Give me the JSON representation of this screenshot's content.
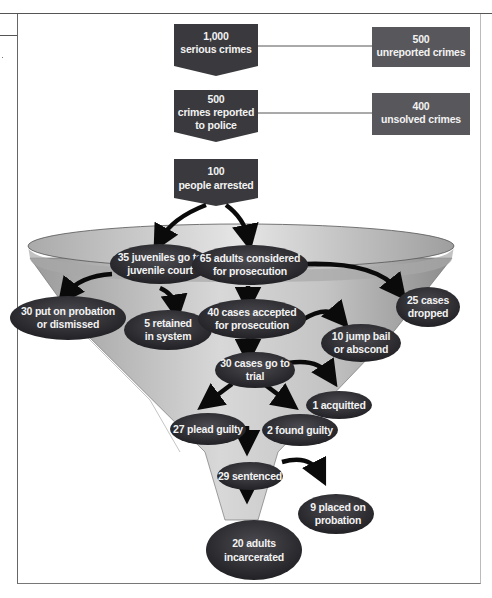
{
  "diagram": {
    "colors": {
      "box_fill": "#3a3a3e",
      "side_box_fill": "#58585c",
      "ellipse_fill": "#333338",
      "funnel_fill": "#bdbdbd",
      "arrow": "#0a0a0a",
      "text": "#f2f2f2"
    },
    "top_boxes": [
      {
        "id": "serious",
        "line1": "1,000",
        "line2": "serious crimes"
      },
      {
        "id": "reported",
        "line1": "500",
        "line2": "crimes reported",
        "line3": "to police"
      },
      {
        "id": "arrested",
        "line1": "100",
        "line2": "people arrested"
      }
    ],
    "side_boxes": [
      {
        "id": "unreported",
        "line1": "500",
        "line2": "unreported crimes"
      },
      {
        "id": "unsolved",
        "line1": "400",
        "line2": "unsolved crimes"
      }
    ],
    "nodes": [
      {
        "id": "juveniles",
        "line1": "35 juveniles go to",
        "line2": "juvenile court"
      },
      {
        "id": "adults",
        "line1": "65 adults considered",
        "line2": "for prosecution"
      },
      {
        "id": "probation_dismissed",
        "line1": "30 put on probation",
        "line2": "or dismissed"
      },
      {
        "id": "retained",
        "line1": "5 retained",
        "line2": "in system"
      },
      {
        "id": "accepted",
        "line1": "40 cases accepted",
        "line2": "for prosecution"
      },
      {
        "id": "dropped",
        "line1": "25 cases",
        "line2": "dropped"
      },
      {
        "id": "jump_bail",
        "line1": "10 jump bail",
        "line2": "or abscond"
      },
      {
        "id": "trial",
        "line1": "30 cases go to",
        "line2": "trial"
      },
      {
        "id": "acquitted",
        "line1": "1 acquitted"
      },
      {
        "id": "plead_guilty",
        "line1": "27 plead guilty"
      },
      {
        "id": "found_guilty",
        "line1": "2 found guilty"
      },
      {
        "id": "sentenced",
        "line1": "29 sentenced"
      },
      {
        "id": "probation",
        "line1": "9 placed on",
        "line2": "probation"
      },
      {
        "id": "incarcerated",
        "line1": "20 adults",
        "line2": "incarcerated"
      }
    ]
  }
}
